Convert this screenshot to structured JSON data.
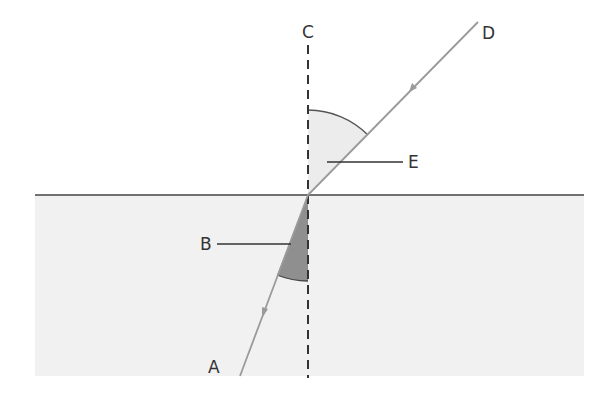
{
  "diagram": {
    "labels": {
      "A": "A",
      "B": "B",
      "C": "C",
      "D": "D",
      "E": "E"
    },
    "elements": {
      "normal": "dashed normal line C",
      "incident_ray": "ray from D to boundary",
      "refracted_ray": "ray from boundary to A",
      "angle_E": "angle of incidence (light shaded)",
      "angle_B": "angle of refraction (dark shaded)",
      "medium": "denser medium (gray region)"
    },
    "colors": {
      "ray": "#9a9a9a",
      "medium": "#f1f1f1",
      "angle_E": "#ececec",
      "angle_B": "#8f8f8f",
      "lines": "#333333"
    }
  }
}
